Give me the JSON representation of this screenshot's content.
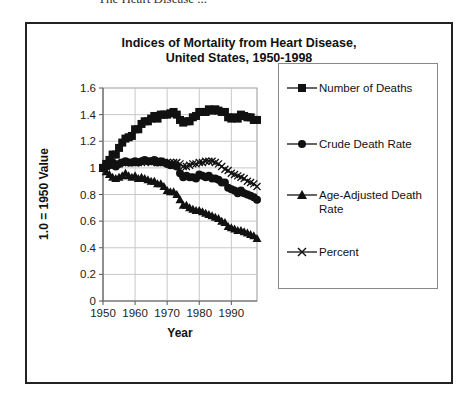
{
  "page": {
    "header_fragment": "The Heart Disease ..."
  },
  "chart_data": {
    "type": "line",
    "title": "Indices of Mortality from Heart Disease,",
    "subtitle": "United States, 1950-1998",
    "xlabel": "Year",
    "ylabel": "1.0 = 1950 Value",
    "xlim": [
      1950,
      1998
    ],
    "ylim": [
      0,
      1.6
    ],
    "xticks": [
      1950,
      1960,
      1970,
      1980,
      1990
    ],
    "xtick_labels": [
      "1950",
      "1960",
      "1970",
      "1980",
      "1990"
    ],
    "yticks": [
      0,
      0.2,
      0.4,
      0.6,
      0.8,
      1,
      1.2,
      1.4,
      1.6
    ],
    "ytick_labels": [
      "0",
      "0.2",
      "0.4",
      "0.6",
      "0.8",
      "1",
      "1.2",
      "1.4",
      "1.6"
    ],
    "grid": true,
    "legend_position": "right",
    "x": [
      1950,
      1951,
      1952,
      1953,
      1954,
      1955,
      1956,
      1957,
      1958,
      1959,
      1960,
      1961,
      1962,
      1963,
      1964,
      1965,
      1966,
      1967,
      1968,
      1969,
      1970,
      1971,
      1972,
      1973,
      1974,
      1975,
      1976,
      1977,
      1978,
      1979,
      1980,
      1981,
      1982,
      1983,
      1984,
      1985,
      1986,
      1987,
      1988,
      1989,
      1990,
      1991,
      1992,
      1993,
      1994,
      1995,
      1996,
      1997,
      1998
    ],
    "series": [
      {
        "name": "Number of Deaths",
        "marker": "square",
        "values": [
          1.0,
          1.03,
          1.06,
          1.1,
          1.1,
          1.15,
          1.19,
          1.22,
          1.23,
          1.24,
          1.29,
          1.29,
          1.33,
          1.35,
          1.35,
          1.37,
          1.39,
          1.37,
          1.4,
          1.4,
          1.4,
          1.41,
          1.42,
          1.4,
          1.36,
          1.34,
          1.35,
          1.35,
          1.38,
          1.39,
          1.42,
          1.42,
          1.42,
          1.44,
          1.43,
          1.44,
          1.43,
          1.42,
          1.42,
          1.38,
          1.37,
          1.38,
          1.37,
          1.4,
          1.39,
          1.38,
          1.38,
          1.36,
          1.36
        ]
      },
      {
        "name": "Crude Death Rate",
        "marker": "circle",
        "values": [
          1.0,
          1.01,
          1.02,
          1.04,
          1.01,
          1.03,
          1.04,
          1.05,
          1.04,
          1.04,
          1.05,
          1.04,
          1.05,
          1.06,
          1.05,
          1.05,
          1.06,
          1.04,
          1.05,
          1.04,
          1.03,
          1.02,
          1.02,
          1.01,
          0.96,
          0.93,
          0.94,
          0.93,
          0.93,
          0.92,
          0.95,
          0.94,
          0.93,
          0.94,
          0.92,
          0.92,
          0.91,
          0.89,
          0.89,
          0.85,
          0.84,
          0.83,
          0.81,
          0.83,
          0.81,
          0.8,
          0.79,
          0.78,
          0.76
        ]
      },
      {
        "name": "Age-Adjusted Death Rate",
        "marker": "triangle",
        "values": [
          1.0,
          0.97,
          0.95,
          0.93,
          0.92,
          0.93,
          0.94,
          0.96,
          0.94,
          0.93,
          0.94,
          0.92,
          0.93,
          0.92,
          0.91,
          0.9,
          0.9,
          0.88,
          0.88,
          0.86,
          0.83,
          0.82,
          0.82,
          0.8,
          0.76,
          0.72,
          0.72,
          0.7,
          0.69,
          0.68,
          0.68,
          0.67,
          0.66,
          0.65,
          0.64,
          0.63,
          0.62,
          0.6,
          0.59,
          0.56,
          0.55,
          0.54,
          0.53,
          0.53,
          0.52,
          0.51,
          0.5,
          0.49,
          0.47
        ]
      },
      {
        "name": "Percent",
        "marker": "x",
        "values": [
          1.0,
          1.01,
          1.02,
          1.03,
          1.03,
          1.03,
          1.04,
          1.04,
          1.04,
          1.04,
          1.04,
          1.04,
          1.04,
          1.05,
          1.05,
          1.04,
          1.05,
          1.04,
          1.05,
          1.04,
          1.04,
          1.04,
          1.04,
          1.04,
          1.03,
          1.01,
          1.01,
          1.02,
          1.03,
          1.03,
          1.04,
          1.04,
          1.05,
          1.05,
          1.05,
          1.04,
          1.03,
          1.01,
          0.99,
          0.98,
          0.96,
          0.95,
          0.94,
          0.93,
          0.92,
          0.9,
          0.89,
          0.88,
          0.86
        ]
      }
    ]
  }
}
